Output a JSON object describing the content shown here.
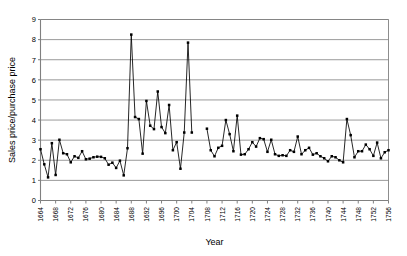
{
  "chart_data": {
    "type": "line",
    "title": "",
    "xlabel": "Year",
    "ylabel": "Sales price/purchase price",
    "xlim": [
      1664,
      1756
    ],
    "ylim": [
      0,
      9
    ],
    "ytick_step": 1,
    "xtick_step": 4,
    "grid": "horizontal",
    "legend": "none",
    "marker": "filled-square",
    "line_color": "#000000",
    "marker_color": "#000000",
    "grid_color": "#808080",
    "axis_color": "#808080",
    "background": "#ffffff",
    "yticks": [
      0,
      1,
      2,
      3,
      4,
      5,
      6,
      7,
      8,
      9
    ],
    "xticks": [
      1664,
      1668,
      1672,
      1676,
      1680,
      1684,
      1688,
      1692,
      1696,
      1700,
      1704,
      1708,
      1712,
      1716,
      1720,
      1724,
      1728,
      1732,
      1736,
      1740,
      1744,
      1748,
      1752,
      1756
    ],
    "series": [
      {
        "name": "Sales price/purchase price",
        "x": [
          1664,
          1665,
          1666,
          1667,
          1668,
          1669,
          1670,
          1671,
          1672,
          1673,
          1674,
          1675,
          1676,
          1677,
          1678,
          1679,
          1680,
          1681,
          1682,
          1683,
          1684,
          1685,
          1686,
          1687,
          1688,
          1689,
          1690,
          1691,
          1692,
          1693,
          1694,
          1695,
          1696,
          1697,
          1698,
          1699,
          1700,
          1701,
          1702,
          1703,
          1704,
          1708,
          1709,
          1710,
          1711,
          1712,
          1713,
          1714,
          1715,
          1716,
          1717,
          1718,
          1719,
          1720,
          1721,
          1722,
          1723,
          1724,
          1725,
          1726,
          1727,
          1728,
          1729,
          1730,
          1731,
          1732,
          1733,
          1734,
          1735,
          1736,
          1737,
          1738,
          1739,
          1740,
          1741,
          1742,
          1743,
          1744,
          1745,
          1746,
          1747,
          1748,
          1749,
          1750,
          1751,
          1752,
          1753,
          1754,
          1755,
          1756
        ],
        "values": [
          2.55,
          1.8,
          1.15,
          2.85,
          1.27,
          3.02,
          2.35,
          2.3,
          1.9,
          2.2,
          2.12,
          2.45,
          2.05,
          2.08,
          2.15,
          2.18,
          2.17,
          2.1,
          1.78,
          1.88,
          1.62,
          1.98,
          1.25,
          2.6,
          8.25,
          4.15,
          4.05,
          2.33,
          4.95,
          3.72,
          3.55,
          5.42,
          3.65,
          3.35,
          4.75,
          2.5,
          2.9,
          1.58,
          3.38,
          7.85,
          3.38,
          3.57,
          2.5,
          2.2,
          2.62,
          2.72,
          4.0,
          3.3,
          2.45,
          4.22,
          2.28,
          2.3,
          2.55,
          2.9,
          2.68,
          3.1,
          3.05,
          2.42,
          3.02,
          2.3,
          2.22,
          2.25,
          2.22,
          2.5,
          2.42,
          3.18,
          2.3,
          2.5,
          2.62,
          2.28,
          2.35,
          2.2,
          2.1,
          1.95,
          2.2,
          2.15,
          2.0,
          1.9,
          4.05,
          3.25,
          2.15,
          2.45,
          2.45,
          2.78,
          2.55,
          2.22,
          2.88,
          2.1,
          2.4,
          2.5
        ]
      }
    ]
  },
  "axis": {
    "ylabel": "Sales price/purchase price",
    "xlabel": "Year"
  }
}
